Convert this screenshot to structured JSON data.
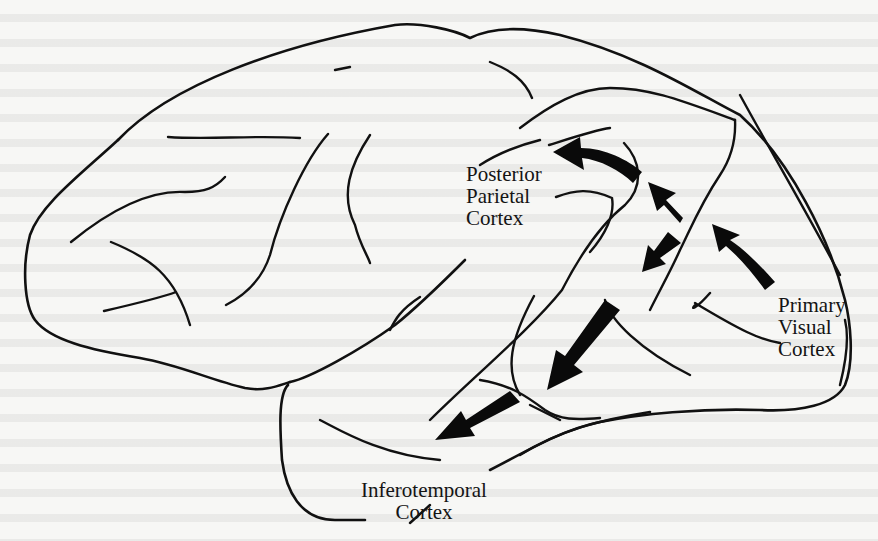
{
  "figure": {
    "type": "lateral view of monkey brain with visual pathways",
    "labels": {
      "posterior_parietal": [
        "Posterior",
        "Parietal",
        "Cortex"
      ],
      "primary_visual": [
        "Primary",
        "Visual",
        "Cortex"
      ],
      "inferotemporal": [
        "Inferotemporal",
        "Cortex"
      ]
    },
    "pathways": [
      {
        "name": "dorsal-stream",
        "from": "Primary Visual Cortex",
        "to": "Posterior Parietal Cortex",
        "arrow_count": 3
      },
      {
        "name": "ventral-stream",
        "from": "Primary Visual Cortex",
        "to": "Inferotemporal Cortex",
        "arrow_count": 3
      }
    ],
    "colors": {
      "line": "#111111",
      "arrow": "#0a0a0a",
      "background": "#f7f7f5"
    }
  }
}
